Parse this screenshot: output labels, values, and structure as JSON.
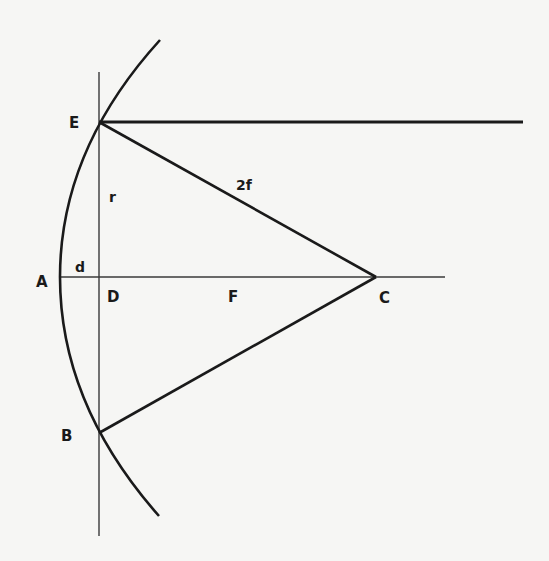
{
  "diagram": {
    "title": "",
    "colors": {
      "background": "#f6f6f4",
      "ink": "#1a1a1a",
      "thin_line": "#3a3a3a"
    },
    "points": {
      "E": {
        "label": "E",
        "x": 99,
        "y": 122
      },
      "A": {
        "label": "A",
        "x": 60,
        "y": 277
      },
      "D": {
        "label": "D",
        "x": 99,
        "y": 277
      },
      "F": {
        "label": "F",
        "x": 233,
        "y": 277
      },
      "C": {
        "label": "C",
        "x": 376,
        "y": 277
      },
      "B": {
        "label": "B",
        "x": 99,
        "y": 433
      }
    },
    "labels": {
      "E": "E",
      "A": "A",
      "B": "B",
      "C": "C",
      "D": "D",
      "F": "F",
      "r": "r",
      "d": "d",
      "two_f": "2f"
    },
    "segments": [
      {
        "name": "mirror-arc",
        "description": "Curved mirror arc through E, A, B"
      },
      {
        "name": "axis",
        "from": "A",
        "to": "C",
        "extends_to_x": 445
      },
      {
        "name": "chord-vertical",
        "through": [
          "E",
          "D",
          "B"
        ]
      },
      {
        "name": "radius-EC",
        "from": "E",
        "to": "C",
        "label": "2f"
      },
      {
        "name": "radius-BC",
        "from": "B",
        "to": "C"
      },
      {
        "name": "incoming-ray",
        "from": "E",
        "to_x": 523
      },
      {
        "name": "half-chord",
        "from": "D",
        "to": "E",
        "label": "r"
      },
      {
        "name": "sagitta",
        "from": "A",
        "to": "D",
        "label": "d"
      }
    ]
  }
}
